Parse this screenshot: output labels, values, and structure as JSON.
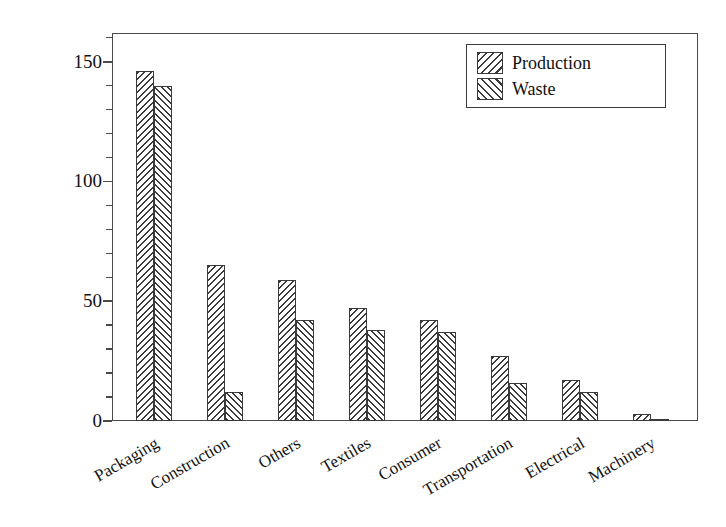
{
  "chart_data": {
    "type": "bar",
    "title": "",
    "subtitle": "",
    "xlabel": "",
    "ylabel": "Annual quantity (Mt)",
    "categories": [
      "Packaging",
      "Construction",
      "Others",
      "Textiles",
      "Consumer",
      "Transportation",
      "Electrical",
      "Machinery"
    ],
    "series": [
      {
        "name": "Production",
        "values": [
          146,
          65,
          59,
          47,
          42,
          27,
          17,
          3
        ]
      },
      {
        "name": "Waste",
        "values": [
          140,
          12,
          42,
          38,
          37,
          16,
          12,
          1
        ]
      }
    ],
    "ylim": [
      0,
      162
    ],
    "y_major_ticks": [
      0,
      50,
      100,
      150
    ],
    "y_tick_labels": [
      "0",
      "50",
      "100",
      "150"
    ],
    "y_minor_interval": 10,
    "grid": false,
    "legend_position": "top-right",
    "legend_entries": [
      "Production",
      "Waste"
    ],
    "xtick_rotation": -30,
    "annotations": []
  },
  "legend": {
    "production_label": "Production",
    "waste_label": "Waste"
  },
  "axes": {
    "y_title": "Annual quantity (Mt)",
    "y_labels": [
      "0",
      "50",
      "100",
      "150"
    ],
    "x_labels": [
      "Packaging",
      "Construction",
      "Others",
      "Textiles",
      "Consumer",
      "Transportation",
      "Electrical",
      "Machinery"
    ]
  },
  "colors": {
    "ink": "#3a3a3a",
    "frame": "#4a4a4a",
    "background": "#ffffff",
    "text": "#111111"
  }
}
